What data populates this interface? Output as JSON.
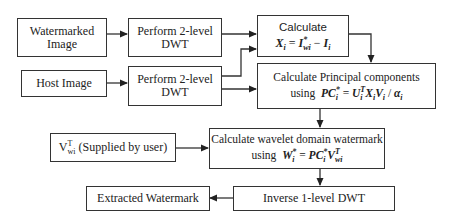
{
  "diagram": {
    "type": "flowchart",
    "nodes": [
      {
        "id": "watermarked_image",
        "lines": [
          "Watermarked",
          "Image"
        ]
      },
      {
        "id": "dwt_top",
        "lines": [
          "Perform 2-level",
          "DWT"
        ]
      },
      {
        "id": "calc_x",
        "line1": "Calculate",
        "formula": {
          "lhs": "X",
          "lhs_sub": "i",
          "eq": "=",
          "t1": "I",
          "t1_sup": "*",
          "t1_sub": "wi",
          "op": "−",
          "t2": "I",
          "t2_sub": "i"
        }
      },
      {
        "id": "host_image",
        "lines": [
          "Host Image"
        ]
      },
      {
        "id": "dwt_bottom",
        "lines": [
          "Perform 2-level",
          "DWT"
        ]
      },
      {
        "id": "calc_pc",
        "line1": "Calculate Principal components",
        "prefix": "using",
        "formula": {
          "lhs": "PC",
          "lhs_sup": "*",
          "lhs_sub": "i",
          "eq": "=",
          "rhs": "U",
          "rhs_sup": "T",
          "rhs_sub": "i",
          "rest": "X",
          "rest_sub": "i",
          "v": "V",
          "v_sub": "i",
          "div": "/",
          "alpha": "α",
          "alpha_sub": "i"
        }
      },
      {
        "id": "v_user",
        "symbol": "V",
        "symbol_sup": "T",
        "symbol_sub": "wi",
        "text": "(Supplied by user)"
      },
      {
        "id": "calc_w",
        "line1": "Calculate wavelet domain watermark",
        "prefix": "using",
        "formula": {
          "lhs": "W",
          "lhs_sup": "*",
          "lhs_sub": "i",
          "eq": "=",
          "rhs": "PC",
          "rhs_sup": "*",
          "rhs_sub": "i",
          "v": "V",
          "v_sup": "T",
          "v_sub": "wi"
        }
      },
      {
        "id": "extracted",
        "lines": [
          "Extracted Watermark"
        ]
      },
      {
        "id": "inverse_dwt",
        "lines": [
          "Inverse 1-level DWT"
        ]
      }
    ],
    "edges": [
      {
        "from": "watermarked_image",
        "to": "dwt_top"
      },
      {
        "from": "host_image",
        "to": "dwt_bottom"
      },
      {
        "from": "dwt_top",
        "to": "calc_x"
      },
      {
        "from": "dwt_bottom",
        "to": "calc_x"
      },
      {
        "from": "dwt_bottom",
        "to": "calc_pc"
      },
      {
        "from": "calc_x",
        "to": "calc_pc"
      },
      {
        "from": "calc_pc",
        "to": "calc_w"
      },
      {
        "from": "v_user",
        "to": "calc_w"
      },
      {
        "from": "calc_w",
        "to": "inverse_dwt"
      },
      {
        "from": "inverse_dwt",
        "to": "extracted"
      }
    ],
    "colors": {
      "line": "#333333",
      "background": "#ffffff",
      "text": "#222222"
    }
  }
}
